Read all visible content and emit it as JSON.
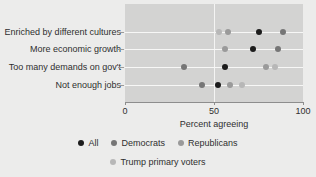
{
  "chart_data": {
    "type": "scatter",
    "title": "",
    "xlabel": "Percent agreeing",
    "ylabel": "",
    "xlim": [
      0,
      100
    ],
    "xticks": [
      0,
      50,
      100
    ],
    "xtick_labels": [
      "0",
      "50",
      "100"
    ],
    "grid": true,
    "legend_position": "bottom",
    "reference_line_x": 50,
    "categories": [
      "Enriched by different cultures",
      "More economic growth",
      "Too many demands on gov't",
      "Not enough jobs"
    ],
    "series": [
      {
        "name": "All",
        "color": "#1c1c1c",
        "values": [
          75,
          72,
          56,
          52
        ]
      },
      {
        "name": "Democrats",
        "color": "#767676",
        "values": [
          89,
          86,
          33,
          43
        ]
      },
      {
        "name": "Republicans",
        "color": "#9a9a9a",
        "values": [
          58,
          56,
          79,
          59
        ]
      },
      {
        "name": "Trump primary voters",
        "color": "#b7b7b7",
        "values": [
          53,
          null,
          84,
          66
        ]
      }
    ]
  },
  "legend": {
    "row1": [
      {
        "label": "All",
        "color": "#1c1c1c"
      },
      {
        "label": "Democrats",
        "color": "#767676"
      },
      {
        "label": "Republicans",
        "color": "#9a9a9a"
      }
    ],
    "row2": [
      {
        "label": "Trump primary voters",
        "color": "#b7b7b7"
      }
    ]
  },
  "axis": {
    "x_title": "Percent agreeing",
    "tick_0": "0",
    "tick_50": "50",
    "tick_100": "100"
  },
  "colors": {
    "page_background": "#ececeb",
    "panel_background": "#d3d3d2",
    "gridline": "#f7f7f6",
    "axis": "#8d8d8d",
    "text": "#2f2f2f"
  }
}
